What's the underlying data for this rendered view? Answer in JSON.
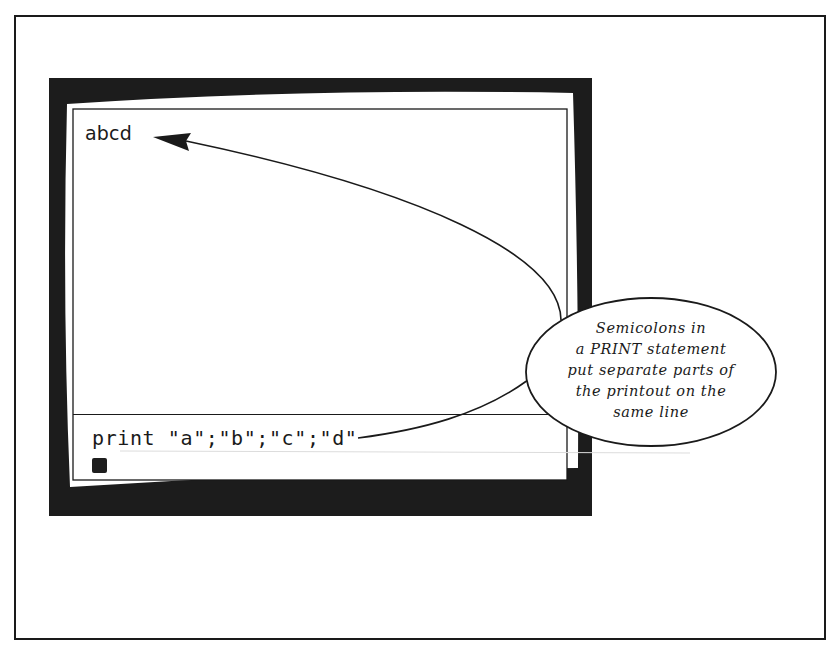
{
  "figure": {
    "colors": {
      "ink": "#1a1a1a",
      "bezel": "#1c1c1c",
      "paper": "#ffffff",
      "faint_rule": "#d8d8d8"
    }
  },
  "screen": {
    "output_text": "abcd",
    "command_text": "print \"a\";\"b\";\"c\";\"d\"",
    "cursor": "block-cursor"
  },
  "callout": {
    "lines": [
      "Semicolons in",
      "a PRINT statement",
      "put separate parts of",
      "the printout on the",
      "same line"
    ]
  },
  "annotations": {
    "arrow_to_output": "arrow-pointing-to-output",
    "connector_to_command": "line-to-command"
  }
}
